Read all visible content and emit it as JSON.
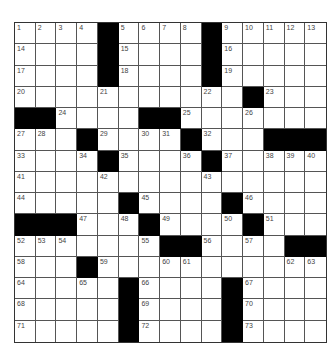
{
  "puzzle": {
    "rows": 15,
    "cols": 15,
    "grid": [
      [
        "1",
        "2",
        "3",
        "4",
        "#",
        "5",
        "6",
        "7",
        "8",
        "#",
        "9",
        "10",
        "11",
        "12",
        "13"
      ],
      [
        "14",
        "",
        "",
        "",
        "#",
        "15",
        "",
        "",
        "",
        "#",
        "16",
        "",
        "",
        "",
        ""
      ],
      [
        "17",
        "",
        "",
        "",
        "#",
        "18",
        "",
        "",
        "",
        "#",
        "19",
        "",
        "",
        "",
        ""
      ],
      [
        "20",
        "",
        "",
        "",
        "21",
        "",
        "",
        "",
        "",
        "22",
        "",
        "#",
        "23",
        "",
        ""
      ],
      [
        "#",
        "#",
        "24",
        "",
        "",
        "",
        "#",
        "#",
        "25",
        "",
        "",
        "26",
        "",
        "",
        ""
      ],
      [
        "27",
        "28",
        "",
        "#",
        "29",
        "",
        "30",
        "31",
        "#",
        "32",
        "",
        "",
        "#",
        "#",
        "#"
      ],
      [
        "33",
        "",
        "",
        "34",
        "#",
        "35",
        "",
        "",
        "36",
        "#",
        "37",
        "",
        "38",
        "39",
        "40"
      ],
      [
        "41",
        "",
        "",
        "",
        "42",
        "",
        "",
        "",
        "",
        "43",
        "",
        "",
        "",
        "",
        ""
      ],
      [
        "44",
        "",
        "",
        "",
        "",
        "#",
        "45",
        "",
        "",
        "",
        "#",
        "46",
        "",
        "",
        ""
      ],
      [
        "#",
        "#",
        "#",
        "47",
        "",
        "48",
        "#",
        "49",
        "",
        "",
        "50",
        "#",
        "51",
        "",
        ""
      ],
      [
        "52",
        "53",
        "54",
        "",
        "",
        "",
        "55",
        "#",
        "#",
        "56",
        "",
        "57",
        "",
        "#",
        "#"
      ],
      [
        "58",
        "",
        "",
        "#",
        "59",
        "",
        "",
        "60",
        "61",
        "",
        "",
        "",
        "",
        "62",
        "63"
      ],
      [
        "64",
        "",
        "",
        "65",
        "",
        "#",
        "66",
        "",
        "",
        "",
        "#",
        "67",
        "",
        "",
        ""
      ],
      [
        "68",
        "",
        "",
        "",
        "",
        "#",
        "69",
        "",
        "",
        "",
        "#",
        "70",
        "",
        "",
        ""
      ],
      [
        "71",
        "",
        "",
        "",
        "",
        "#",
        "72",
        "",
        "",
        "",
        "#",
        "73",
        "",
        "",
        ""
      ]
    ]
  }
}
